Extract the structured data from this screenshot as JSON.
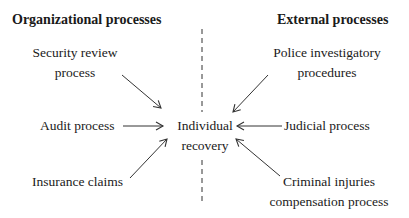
{
  "headings": {
    "left": "Organizational processes",
    "right": "External processes"
  },
  "center": {
    "line1": "Individual",
    "line2": "recovery"
  },
  "organizational": [
    {
      "line1": "Security review",
      "line2": "process"
    },
    {
      "line1": "Audit process"
    },
    {
      "line1": "Insurance claims"
    }
  ],
  "external": [
    {
      "line1": "Police investigatory",
      "line2": "procedures"
    },
    {
      "line1": "Judicial process"
    },
    {
      "line1": "Criminal injuries",
      "line2": "compensation process"
    }
  ],
  "colors": {
    "text": "#1a1a1a",
    "line": "#333333",
    "background": "#ffffff"
  }
}
